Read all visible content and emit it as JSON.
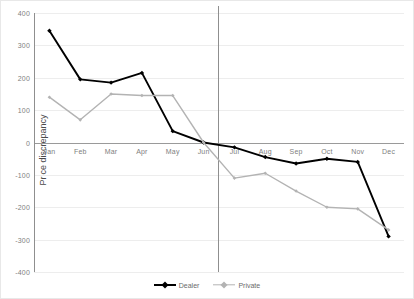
{
  "chart_data": {
    "type": "line",
    "title": "",
    "xlabel": "",
    "ylabel": "Price discrepancy",
    "categories": [
      "Jan",
      "Feb",
      "Mar",
      "Apr",
      "May",
      "Jun",
      "Jul",
      "Aug",
      "Sep",
      "Oct",
      "Nov",
      "Dec"
    ],
    "ylim": [
      -400,
      400
    ],
    "ytick_labels": [
      "400",
      "300",
      "200",
      "100",
      "0",
      "-100",
      "-200",
      "-300",
      "-400"
    ],
    "ytick_values": [
      400,
      300,
      200,
      100,
      0,
      -100,
      -200,
      -300,
      -400
    ],
    "grid": true,
    "legend_position": "bottom-center",
    "annotations": {
      "vertical_divider_between": [
        "Jun",
        "Jul"
      ]
    },
    "series": [
      {
        "name": "Dealer",
        "color": "#000000",
        "marker": "diamond",
        "values": [
          345,
          195,
          185,
          215,
          35,
          0,
          -15,
          -45,
          -65,
          -50,
          -60,
          -290
        ]
      },
      {
        "name": "Private",
        "color": "#b3b3b3",
        "marker": "diamond",
        "values": [
          140,
          70,
          150,
          145,
          145,
          0,
          -110,
          -95,
          -150,
          -200,
          -205,
          -270
        ]
      }
    ]
  },
  "legend": {
    "entries": [
      {
        "label": "Dealer"
      },
      {
        "label": "Private"
      }
    ]
  },
  "top_clip_text": ""
}
